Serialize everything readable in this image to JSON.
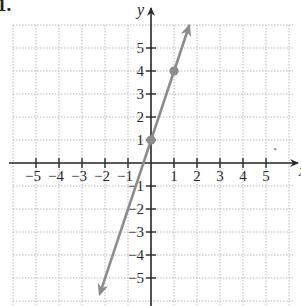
{
  "problem_label": "1.",
  "chart_data": {
    "type": "line",
    "title": "",
    "xlabel": "x",
    "ylabel": "y",
    "xlim": [
      -6,
      6
    ],
    "ylim": [
      -6,
      6
    ],
    "grid": true,
    "x_ticks": [
      -5,
      -4,
      -3,
      -2,
      -1,
      1,
      2,
      3,
      4,
      5
    ],
    "y_ticks": [
      -5,
      -4,
      -3,
      -2,
      -1,
      1,
      2,
      3,
      4,
      5
    ],
    "x_tick_labels": [
      "−5",
      "−4",
      "−3",
      "−2",
      "−1",
      "1",
      "2",
      "3",
      "4",
      "5"
    ],
    "y_tick_labels": [
      "−5",
      "−4",
      "−3",
      "−2",
      "−1",
      "1",
      "2",
      "3",
      "4",
      "5"
    ],
    "series": [
      {
        "name": "y = 3x + 1",
        "slope": 3,
        "intercept": 1,
        "color": "#8c8c8c",
        "arrows": "both",
        "x": [
          -2.23,
          1.67
        ],
        "y": [
          -5.7,
          6.0
        ],
        "points": [
          {
            "x": 0,
            "y": 1
          },
          {
            "x": 1,
            "y": 4
          }
        ]
      }
    ],
    "annotations": [
      {
        "type": "stray-dot",
        "x": 5.4,
        "y": 0.6
      }
    ]
  },
  "colors": {
    "axis": "#2a2a2a",
    "grid": "#b9b9b9",
    "line": "#8c8c8c",
    "point": "#8c8c8c"
  }
}
